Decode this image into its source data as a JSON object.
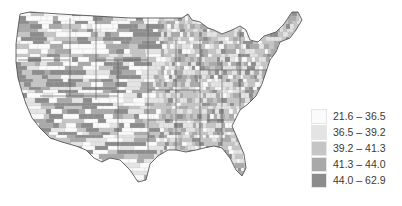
{
  "map": {
    "region": "Contiguous United States",
    "subdivision": "counties",
    "style": "grayscale choropleth"
  },
  "legend": {
    "items": [
      {
        "label": "21.6 – 36.5",
        "color": "#fbfbfb"
      },
      {
        "label": "36.5 – 39.2",
        "color": "#e4e4e4"
      },
      {
        "label": "39.2 – 41.3",
        "color": "#c5c5c5"
      },
      {
        "label": "41.3 – 44.0",
        "color": "#a9a9a9"
      },
      {
        "label": "44.0 – 62.9",
        "color": "#8c8c8c"
      }
    ]
  }
}
